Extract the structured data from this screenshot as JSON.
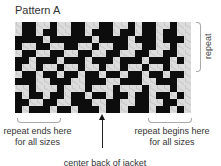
{
  "title": "Pattern A",
  "repeat_label": "repeat",
  "left_label": "repeat ends here for all sizes",
  "right_label": "repeat begins here for all sizes",
  "bottom_label": "center back of jacket",
  "colors": {
    "dark": "#0d0d0d",
    "light": "#dcdcdc"
  },
  "grid": {
    "columns": 25,
    "rows": 13,
    "pattern": [
      "LDDLLDLLDDLLDDLLDLDDLLDLL",
      "LDDLDDLLDDLDDDLDDLDDLDDLL",
      "DDDDLDDDDDDLDDDDLDDDLDDDL",
      "DLLDDLLDDLLDLLDDLLDDLLDLL",
      "LDDLLDDLLDDLLDDLLDDLLDDLL",
      "DDLDDDLDDDLDDDLDDDLDDDLDL",
      "DLLDLLDLLDLLDLLDLLDLLDLLL",
      "LDDLDDLDDLDDLDDLDDLDDLDDL",
      "DDDLLDDDLLDDDLLDDDLLDDDLL",
      "LLDLLLDLLLDLLLDLLLDLLLDLL",
      "DLDDLDDLDDLDDLDDLDDLDDLDL",
      "DDLLDDLLDDDLLDDLLDDLLDDLL",
      "DLDDDLDDLDDDLDDLDDDLDDLDL"
    ]
  }
}
